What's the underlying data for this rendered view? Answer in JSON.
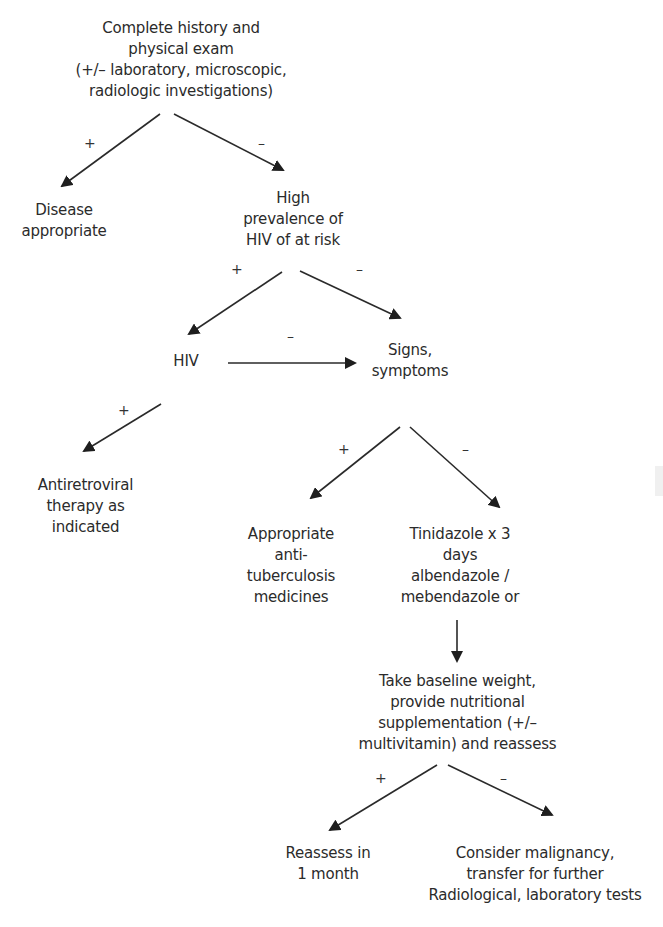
{
  "diagram": {
    "type": "flowchart",
    "nodes": {
      "history": {
        "text": "Complete history and\nphysical exam\n(+/– laboratory, microscopic,\nradiologic investigations)"
      },
      "disease_appropriate": {
        "text": "Disease\nappropriate"
      },
      "high_prevalence": {
        "text": "High\nprevalence of\nHIV of at risk"
      },
      "hiv": {
        "text": "HIV"
      },
      "signs_symptoms": {
        "text": "Signs,\nsymptoms"
      },
      "antiretroviral": {
        "text": "Antiretroviral\ntherapy as\nindicated"
      },
      "anti_tb": {
        "text": "Appropriate\nanti-\ntuberculosis\nmedicines"
      },
      "tinidazole": {
        "text": "Tinidazole x 3\ndays\nalbendazole /\nmebendazole or"
      },
      "baseline_weight": {
        "text": "Take baseline weight,\nprovide nutritional\nsupplementation (+/–\nmultivitamin) and reassess"
      },
      "reassess": {
        "text": "Reassess in\n1 month"
      },
      "malignancy": {
        "text": "Consider malignancy,\ntransfer for further\nRadiological, laboratory tests"
      }
    },
    "edges": [
      {
        "from": "history",
        "to": "disease_appropriate",
        "label": "+"
      },
      {
        "from": "history",
        "to": "high_prevalence",
        "label": "–"
      },
      {
        "from": "high_prevalence",
        "to": "hiv",
        "label": "+"
      },
      {
        "from": "high_prevalence",
        "to": "signs_symptoms",
        "label": "–"
      },
      {
        "from": "hiv",
        "to": "signs_symptoms",
        "label": "–"
      },
      {
        "from": "hiv",
        "to": "antiretroviral",
        "label": "+"
      },
      {
        "from": "signs_symptoms",
        "to": "anti_tb",
        "label": "+"
      },
      {
        "from": "signs_symptoms",
        "to": "tinidazole",
        "label": "–"
      },
      {
        "from": "tinidazole",
        "to": "baseline_weight",
        "label": ""
      },
      {
        "from": "baseline_weight",
        "to": "reassess",
        "label": "+"
      },
      {
        "from": "baseline_weight",
        "to": "malignancy",
        "label": "–"
      }
    ],
    "labels": {
      "plus": "+",
      "minus": "–"
    },
    "colors": {
      "background": "#ffffff",
      "text": "#2b2b2b",
      "stroke": "#2a2a2a"
    }
  }
}
